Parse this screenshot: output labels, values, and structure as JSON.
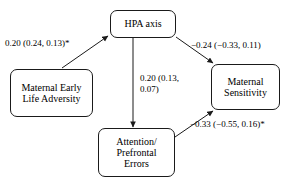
{
  "diagram": {
    "type": "path-diagram",
    "nodes": [
      {
        "id": "hpa",
        "label": "HPA axis"
      },
      {
        "id": "adversity",
        "label": "Maternal Early\nLife Adversity"
      },
      {
        "id": "sensitivity",
        "label": "Maternal\nSensitivity"
      },
      {
        "id": "attention",
        "label": "Attention/\nPrefrontal\nErrors"
      }
    ],
    "edges": [
      {
        "id": "adversity-hpa",
        "from": "adversity",
        "to": "hpa",
        "label": "0.20 (0.24, 0.13)*",
        "coefficient": 0.2,
        "interval": [
          0.24,
          0.13
        ],
        "significant": true
      },
      {
        "id": "hpa-sensitivity",
        "from": "hpa",
        "to": "sensitivity",
        "label": "−0.24 (−0.33, 0.11)",
        "coefficient": -0.24,
        "interval": [
          -0.33,
          0.11
        ],
        "significant": false
      },
      {
        "id": "hpa-attention",
        "from": "hpa",
        "to": "attention",
        "label": "0.20 (0.13,\n0.07)",
        "coefficient": 0.2,
        "interval": [
          0.13,
          0.07
        ],
        "significant": false
      },
      {
        "id": "attention-sensitivity",
        "from": "attention",
        "to": "sensitivity",
        "label": "−0.33 (−0.55, 0.16)*",
        "coefficient": -0.33,
        "interval": [
          -0.55,
          0.16
        ],
        "significant": true
      }
    ],
    "colors": {
      "stroke": "#1a1a1a",
      "text": "#000000",
      "background": "#ffffff"
    }
  }
}
